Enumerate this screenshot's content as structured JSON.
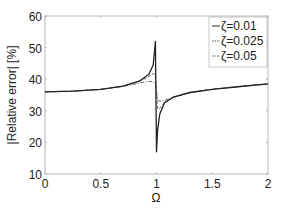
{
  "chart_data": {
    "type": "line",
    "title": "",
    "xlabel": "Ω",
    "ylabel": "|Relative error| [%]",
    "xlim": [
      0,
      2
    ],
    "ylim": [
      10,
      60
    ],
    "xticks": [
      0,
      0.5,
      1,
      1.5,
      2
    ],
    "xtick_labels": [
      "0",
      "0.5",
      "1",
      "1.5",
      "2"
    ],
    "yticks": [
      10,
      20,
      30,
      40,
      50,
      60
    ],
    "ytick_labels": [
      "10",
      "20",
      "30",
      "40",
      "50",
      "60"
    ],
    "grid": false,
    "legend_position": "upper right",
    "series": [
      {
        "name": "ζ=0.01",
        "style": "solid",
        "x": [
          0,
          0.25,
          0.5,
          0.7,
          0.85,
          0.93,
          0.97,
          0.99,
          1.0,
          1.01,
          1.03,
          1.07,
          1.15,
          1.3,
          1.5,
          1.75,
          2.0
        ],
        "y": [
          36,
          36.2,
          36.8,
          37.8,
          39.5,
          41.5,
          44.5,
          52,
          17,
          24,
          29,
          32.5,
          34.3,
          35.8,
          36.8,
          37.7,
          38.5
        ]
      },
      {
        "name": "ζ=0.025",
        "style": "dashed",
        "x": [
          0,
          0.25,
          0.5,
          0.7,
          0.85,
          0.93,
          0.97,
          0.99,
          1.0,
          1.01,
          1.03,
          1.07,
          1.15,
          1.3,
          1.5,
          1.75,
          2.0
        ],
        "y": [
          36,
          36.2,
          36.8,
          37.8,
          39.3,
          40.8,
          41.8,
          41.5,
          36,
          30.5,
          30.8,
          32.5,
          34.2,
          35.8,
          36.8,
          37.7,
          38.5
        ]
      },
      {
        "name": "ζ=0.05",
        "style": "dash-dot",
        "x": [
          0,
          0.25,
          0.5,
          0.7,
          0.85,
          0.93,
          0.97,
          0.99,
          1.0,
          1.01,
          1.03,
          1.07,
          1.15,
          1.3,
          1.5,
          1.75,
          2.0
        ],
        "y": [
          36,
          36.2,
          36.8,
          37.7,
          38.8,
          39.3,
          39.2,
          38.5,
          36,
          33.5,
          33,
          33.3,
          34.3,
          35.8,
          36.8,
          37.7,
          38.5
        ]
      }
    ]
  },
  "legend": {
    "items": [
      {
        "label": "ζ=0.01",
        "style": "solid"
      },
      {
        "label": "ζ=0.025",
        "style": "dashed"
      },
      {
        "label": "ζ=0.05",
        "style": "dash-dot"
      }
    ]
  },
  "colors": {
    "axis": "#b0b0b0",
    "line": "#222222",
    "text": "#222222"
  }
}
